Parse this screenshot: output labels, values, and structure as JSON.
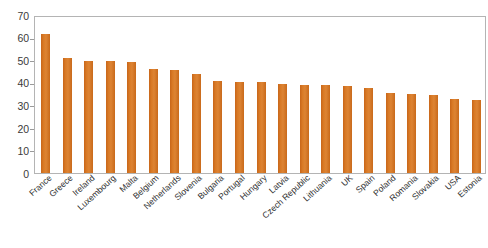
{
  "chart_data": {
    "type": "bar",
    "title": "",
    "subtitle": "",
    "xlabel": "",
    "ylabel": "",
    "ylim": [
      0,
      70
    ],
    "ytick_step": 10,
    "yticks": [
      70,
      60,
      50,
      40,
      30,
      20,
      10,
      0
    ],
    "grid": false,
    "legend": null,
    "bar_color": "#D2701E",
    "axis_color": "#B4B4B4",
    "label_color": "#2F2F2F",
    "categories": [
      "France",
      "Greece",
      "Ireland",
      "Luxembourg",
      "Malta",
      "Belgium",
      "Netherlands",
      "Slovenia",
      "Bulgaria",
      "Portugal",
      "Hungary",
      "Latvia",
      "Czech Republic",
      "Lithuania",
      "UK",
      "Spain",
      "Poland",
      "Romania",
      "Slovakia",
      "USA",
      "Estonia"
    ],
    "values": [
      61.8,
      50.8,
      49.6,
      49.5,
      49.0,
      46.2,
      45.7,
      44.0,
      40.8,
      40.5,
      40.3,
      39.3,
      39.0,
      38.9,
      38.6,
      37.6,
      35.4,
      35.0,
      34.6,
      33.0,
      32.2
    ]
  }
}
